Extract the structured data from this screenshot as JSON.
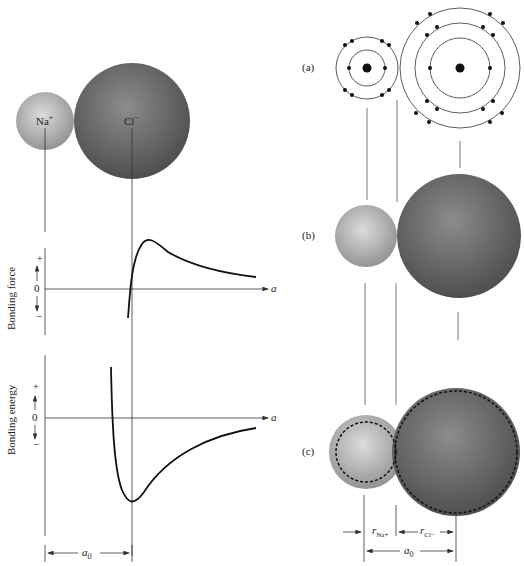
{
  "left_panel": {
    "ions": {
      "na_label": "Na",
      "na_charge": "+",
      "cl_label": "Cl",
      "cl_charge": "−"
    },
    "force_plot": {
      "ylabel": "Bonding force",
      "plus": "+",
      "zero": "0",
      "minus": "−",
      "xlabel": "a"
    },
    "energy_plot": {
      "ylabel": "Bonding energy",
      "plus": "+",
      "zero": "0",
      "minus": "−",
      "xlabel": "a"
    },
    "a0_label": "a",
    "a0_sub": "0"
  },
  "right_panel": {
    "label_a": "(a)",
    "label_b": "(b)",
    "label_c": "(c)",
    "r_na_label": "r",
    "r_na_sub": "Na+",
    "r_cl_label": "r",
    "r_cl_sub": "Cl−",
    "a0_label": "a",
    "a0_sub": "0"
  },
  "colors": {
    "na_sphere": "#b8b8b8",
    "cl_sphere": "#6e6e6e",
    "line": "#333333",
    "dashed": "#111111"
  }
}
